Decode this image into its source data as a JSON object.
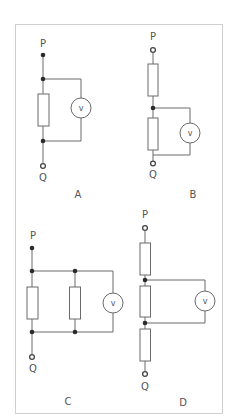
{
  "figure": {
    "colors": {
      "wire": "#6a6a6a",
      "frame": "#cfcfcf",
      "junction": "#2a2a2a",
      "text": "#555555"
    }
  },
  "circuits": [
    {
      "id": "A",
      "caption": "A",
      "top_terminal": "P",
      "bottom_terminal": "Q",
      "meter_symbol": "v",
      "resistors": 1,
      "description": "Voltmeter in parallel across a single resistor"
    },
    {
      "id": "B",
      "caption": "B",
      "top_terminal": "P",
      "bottom_terminal": "Q",
      "meter_symbol": "v",
      "resistors": 2,
      "description": "Two resistors in series; voltmeter across the lower resistor"
    },
    {
      "id": "C",
      "caption": "C",
      "top_terminal": "P",
      "bottom_terminal": "Q",
      "meter_symbol": "v",
      "resistors": 2,
      "description": "Two resistors in parallel with voltmeter also in parallel"
    },
    {
      "id": "D",
      "caption": "D",
      "top_terminal": "P",
      "bottom_terminal": "Q",
      "meter_symbol": "v",
      "resistors": 3,
      "description": "Three resistors in series; voltmeter across the middle resistor"
    }
  ]
}
